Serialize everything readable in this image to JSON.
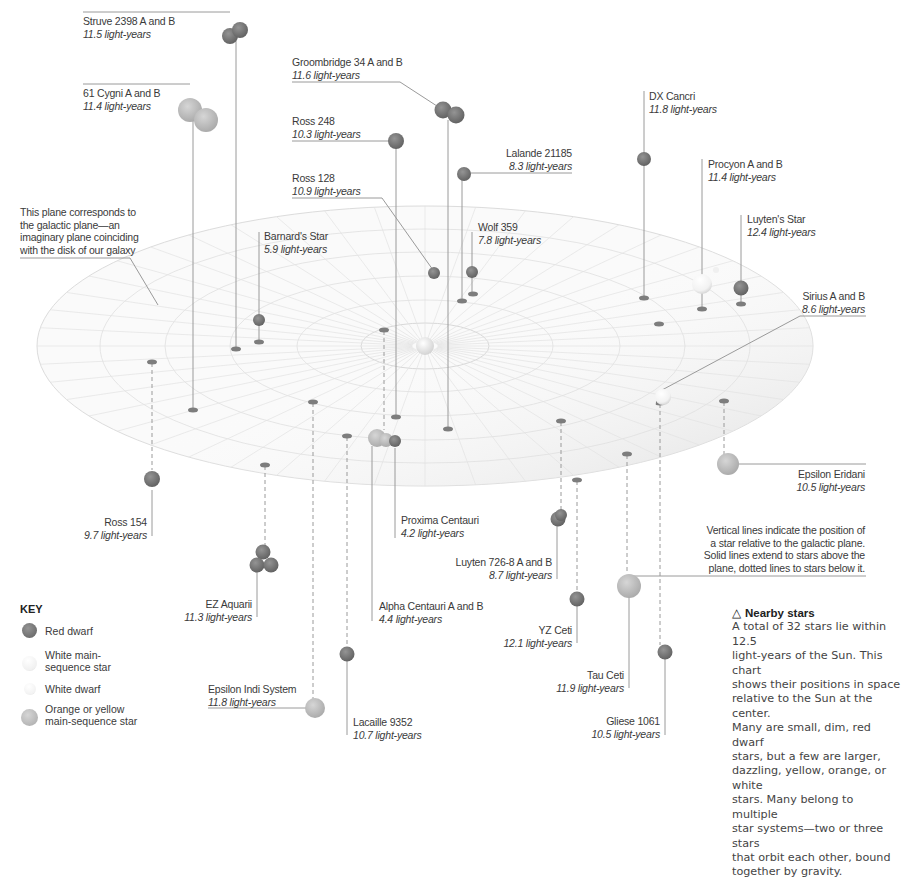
{
  "annotations": {
    "plane_note": [
      "This plane corresponds to",
      "the galactic plane—an",
      "imaginary plane coinciding",
      "with the disk of our galaxy"
    ],
    "lines_note": [
      "Vertical lines indicate the position of",
      "a star relative to the galactic plane.",
      "Solid lines extend to stars above the",
      "plane, dotted lines to stars below it."
    ]
  },
  "key": {
    "title": "KEY",
    "items": [
      {
        "label": [
          "Red dwarf"
        ],
        "color": "#7a7a7a",
        "icon": "red-dwarf-icon"
      },
      {
        "label": [
          "White main-",
          "sequence star"
        ],
        "color": "#f4f4f4",
        "icon": "white-main-sequence-icon"
      },
      {
        "label": [
          "White dwarf"
        ],
        "color": "#f7f7f7",
        "icon": "white-dwarf-icon"
      },
      {
        "label": [
          "Orange or yellow",
          "main-sequence star"
        ],
        "color": "#bdbdbd",
        "icon": "orange-yellow-star-icon"
      }
    ]
  },
  "sidebar": {
    "heading_icon": "△",
    "heading": "Nearby stars",
    "lines": [
      "A total of 32 stars lie within 12.5",
      "light-years of the Sun. This chart",
      "shows their positions in space",
      "relative to the Sun at the center.",
      "Many are small, dim, red dwarf",
      "stars, but a few are larger,",
      "dazzling, yellow, orange, or white",
      "stars. Many belong to multiple",
      "star systems—two or three stars",
      "that orbit each other, bound",
      "together by gravity."
    ]
  },
  "stars": [
    {
      "name": "Struve 2398 A and B",
      "distance": "11.5 light-years"
    },
    {
      "name": "61 Cygni A and B",
      "distance": "11.4 light-years"
    },
    {
      "name": "Groombridge 34 A and B",
      "distance": "11.6 light-years"
    },
    {
      "name": "Ross 248",
      "distance": "10.3 light-years"
    },
    {
      "name": "Ross 128",
      "distance": "10.9 light-years"
    },
    {
      "name": "Lalande 21185",
      "distance": "8.3 light-years"
    },
    {
      "name": "Barnard's Star",
      "distance": "5.9 light-years"
    },
    {
      "name": "Wolf 359",
      "distance": "7.8 light-years"
    },
    {
      "name": "DX Cancri",
      "distance": "11.8 light-years"
    },
    {
      "name": "Procyon A and B",
      "distance": "11.4 light-years"
    },
    {
      "name": "Luyten's Star",
      "distance": "12.4 light-years"
    },
    {
      "name": "Sirius A and B",
      "distance": "8.6 light-years"
    },
    {
      "name": "Epsilon Eridani",
      "distance": "10.5 light-years"
    },
    {
      "name": "Ross 154",
      "distance": "9.7 light-years"
    },
    {
      "name": "Proxima Centauri",
      "distance": "4.2 light-years"
    },
    {
      "name": "Luyten 726-8 A and B",
      "distance": "8.7 light-years"
    },
    {
      "name": "EZ Aquarii",
      "distance": "11.3 light-years"
    },
    {
      "name": "Alpha Centauri A and B",
      "distance": "4.4 light-years"
    },
    {
      "name": "YZ Ceti",
      "distance": "12.1 light-years"
    },
    {
      "name": "Tau Ceti",
      "distance": "11.9 light-years"
    },
    {
      "name": "Epsilon Indi System",
      "distance": "11.8 light-years"
    },
    {
      "name": "Lacaille 9352",
      "distance": "10.7 light-years"
    },
    {
      "name": "Gliese 1061",
      "distance": "10.5 light-years"
    }
  ],
  "colors": {
    "red_dwarf": "#7a7a7a",
    "orange_yellow": "#bdbdbd",
    "white": "#f4f4f4",
    "grid": "#d8d8d8",
    "line": "#9a9a9a"
  }
}
